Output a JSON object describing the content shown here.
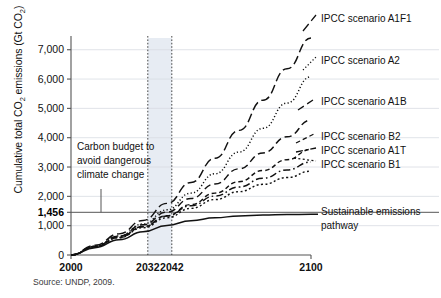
{
  "chart_data": {
    "type": "line",
    "title": "",
    "xlabel": "",
    "ylabel": "Cumulative total CO2 emissions (Gt CO2)",
    "ylabel_parts": {
      "pre": "Cumulative total CO",
      "sub1": "2",
      "mid": " emissions (Gt CO",
      "sub2": "2",
      "post": ")"
    },
    "xlim": [
      2000,
      2100
    ],
    "ylim": [
      0,
      7400
    ],
    "grid": true,
    "legend_position": "right-inline-labels",
    "yticks": [
      0,
      1000,
      1456,
      2000,
      3000,
      4000,
      5000,
      6000,
      7000
    ],
    "ytick_labels": [
      "0",
      "1,000",
      "1,456",
      "2,000",
      "3,000",
      "4,000",
      "5,000",
      "6,000",
      "7,000"
    ],
    "ytick_emphasis": [
      "",
      "",
      "bold",
      "",
      "",
      "",
      "",
      "",
      ""
    ],
    "xticks": [
      2000,
      2032,
      2042,
      2100
    ],
    "xtick_labels": [
      "2000",
      "2032",
      "2042",
      "2100"
    ],
    "highlight_band": {
      "from": 2032,
      "to": 2042,
      "color": "#dfe5ef"
    },
    "threshold_line": {
      "value": 1456,
      "label": "1,456"
    },
    "annotation": {
      "lines": [
        "Carbon budget to",
        "avoid dangerous",
        "climate change"
      ],
      "leader_to_value": 1456
    },
    "series": [
      {
        "name": "IPCC scenario A1F1",
        "label": "IPCC scenario A1F1",
        "style": "long-dash",
        "x": [
          2000,
          2010,
          2020,
          2030,
          2040,
          2050,
          2060,
          2070,
          2080,
          2090,
          2100
        ],
        "values": [
          0,
          330,
          720,
          1180,
          1760,
          2470,
          3300,
          4250,
          5280,
          6350,
          7400
        ]
      },
      {
        "name": "IPCC scenario A2",
        "label": "IPCC scenario A2",
        "style": "fine-dot",
        "x": [
          2000,
          2010,
          2020,
          2030,
          2040,
          2050,
          2060,
          2070,
          2080,
          2090,
          2100
        ],
        "values": [
          0,
          300,
          650,
          1060,
          1540,
          2110,
          2770,
          3510,
          4320,
          5180,
          6080
        ]
      },
      {
        "name": "IPCC scenario A1B",
        "label": "IPCC scenario A1B",
        "style": "dash",
        "x": [
          2000,
          2010,
          2020,
          2030,
          2040,
          2050,
          2060,
          2070,
          2080,
          2090,
          2100
        ],
        "values": [
          0,
          300,
          640,
          1030,
          1460,
          1930,
          2420,
          2940,
          3480,
          4030,
          4600
        ]
      },
      {
        "name": "IPCC scenario B2",
        "label": "IPCC scenario B2",
        "style": "short-dash",
        "x": [
          2000,
          2010,
          2020,
          2030,
          2040,
          2050,
          2060,
          2070,
          2080,
          2090,
          2100
        ],
        "values": [
          0,
          280,
          600,
          960,
          1340,
          1720,
          2110,
          2500,
          2880,
          3250,
          3600
        ]
      },
      {
        "name": "IPCC scenario A1T",
        "label": "IPCC scenario A1T",
        "style": "dash-dot",
        "x": [
          2000,
          2010,
          2020,
          2030,
          2040,
          2050,
          2060,
          2070,
          2080,
          2090,
          2100
        ],
        "values": [
          0,
          285,
          610,
          970,
          1330,
          1680,
          2010,
          2320,
          2620,
          2900,
          3170
        ]
      },
      {
        "name": "IPCC scenario B1",
        "label": "IPCC scenario B1",
        "style": "dot",
        "x": [
          2000,
          2010,
          2020,
          2030,
          2040,
          2050,
          2060,
          2070,
          2080,
          2090,
          2100
        ],
        "values": [
          0,
          275,
          590,
          930,
          1270,
          1590,
          1890,
          2160,
          2410,
          2640,
          2860
        ]
      },
      {
        "name": "Sustainable emissions pathway",
        "label": "Sustainable emissions pathway",
        "label_lines": [
          "Sustainable emissions",
          "pathway"
        ],
        "style": "solid",
        "x": [
          2000,
          2010,
          2020,
          2030,
          2040,
          2050,
          2060,
          2070,
          2080,
          2090,
          2100
        ],
        "values": [
          0,
          250,
          520,
          790,
          1010,
          1170,
          1270,
          1330,
          1360,
          1380,
          1390
        ]
      }
    ]
  },
  "source": {
    "text": "Source: UNDP, 2009."
  }
}
